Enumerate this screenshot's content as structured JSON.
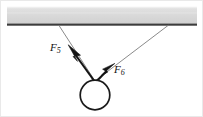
{
  "figure": {
    "type": "free-body-diagram",
    "canvas": {
      "width": 203,
      "height": 117,
      "background": "#ffffff"
    },
    "ceiling": {
      "name": "ceiling-bar",
      "x": 7,
      "y": 6,
      "width": 190,
      "height": 19,
      "fill": "#d9d9d9",
      "top_highlight": "#f2f2f2",
      "bottom_edge_color": "#3a3a3a",
      "bottom_edge_thickness": 2
    },
    "ball": {
      "name": "ball",
      "cx": 95,
      "cy": 95,
      "r": 15,
      "stroke": "#1a1a1a",
      "stroke_width": 1.6,
      "fill": "#ffffff"
    },
    "strings": [
      {
        "name": "left-string",
        "from": {
          "x": 59,
          "y": 25
        },
        "to": {
          "x": 95,
          "y": 81
        },
        "stroke": "#7d7d7d",
        "stroke_width": 0.9
      },
      {
        "name": "right-string",
        "from": {
          "x": 168,
          "y": 25
        },
        "to": {
          "x": 95,
          "y": 81
        },
        "stroke": "#7d7d7d",
        "stroke_width": 0.9
      }
    ],
    "forces": [
      {
        "name": "force-vector-f5",
        "label": "F",
        "subscript": "5",
        "tail": {
          "x": 95,
          "y": 82
        },
        "head": {
          "x": 69,
          "y": 46
        },
        "stroke": "#141414",
        "stroke_width": 2.1,
        "label_position": {
          "x": 50,
          "y": 42
        }
      },
      {
        "name": "force-vector-f6",
        "label": "F",
        "subscript": "6",
        "tail": {
          "x": 95,
          "y": 83
        },
        "head": {
          "x": 114,
          "y": 64
        },
        "stroke": "#141414",
        "stroke_width": 2.1,
        "label_position": {
          "x": 114,
          "y": 64
        }
      }
    ],
    "border": {
      "name": "figure-border",
      "color": "#e6e6e6",
      "visible": true
    }
  }
}
